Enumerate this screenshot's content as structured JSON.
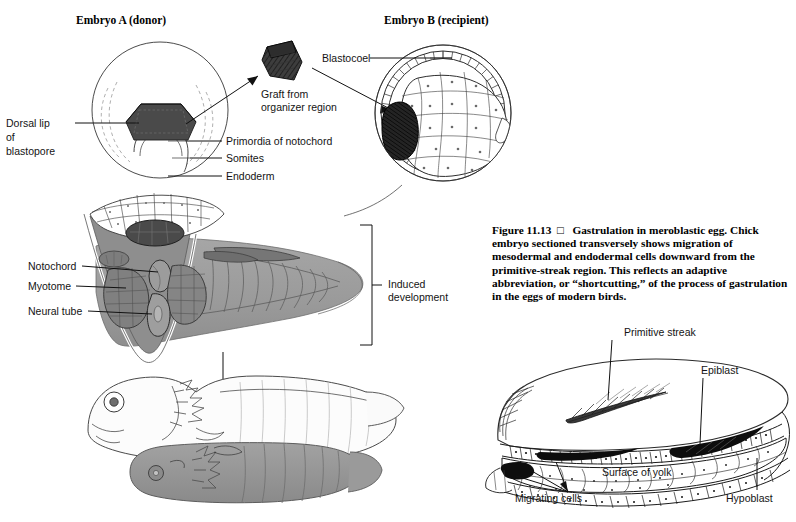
{
  "figure": {
    "number": "Figure 11.13",
    "marker": "□",
    "caption": "Gastrulation in meroblastic egg. Chick embryo sectioned transversely shows migration of mesodermal and endodermal cells downward from the primitive-streak region. This reflects an adaptive abbreviation, or “shortcutting,” of the process of gastrulation in the eggs of modern birds."
  },
  "panels": {
    "embryo_a": {
      "title": "Embryo A (donor)",
      "labels": {
        "dorsal_lip_1": "Dorsal lip",
        "dorsal_lip_2": "of",
        "dorsal_lip_3": "blastopore",
        "primordia": "Primordia of notochord",
        "somites": "Somites",
        "endoderm": "Endoderm"
      }
    },
    "graft": {
      "line1": "Graft from",
      "line2": "organizer region"
    },
    "embryo_b": {
      "title": "Embryo B (recipient)",
      "labels": {
        "blastocoel": "Blastocoel"
      }
    },
    "section": {
      "labels": {
        "notochord": "Notochord",
        "myotome": "Myotome",
        "neural_tube": "Neural tube",
        "induced_1": "Induced",
        "induced_2": "development"
      }
    },
    "chick": {
      "labels": {
        "primitive_streak": "Primitive streak",
        "epiblast": "Epiblast",
        "hypoblast": "Hypoblast",
        "surface_of_yolk": "Surface of yolk",
        "migrating_cells": "Migrating cells"
      }
    }
  },
  "colors": {
    "ink": "#141414",
    "graft_dark": "#3a3a3a",
    "body_gray": "#9a9a9a",
    "light_gray": "#d2d2d2",
    "paper": "#ffffff"
  }
}
